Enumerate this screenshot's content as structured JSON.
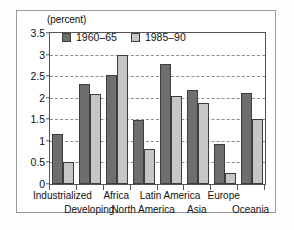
{
  "chart_data": {
    "type": "bar",
    "title": "",
    "subtitle": "",
    "xlabel": "",
    "ylabel": "",
    "unit_label": "(percent)",
    "categories": [
      "Industrialized",
      "Developing",
      "Africa",
      "North America",
      "Latin America",
      "Asia",
      "Europe",
      "Oceania"
    ],
    "category_rows": [
      0,
      1,
      0,
      1,
      0,
      1,
      0,
      1
    ],
    "series": [
      {
        "name": "1960–65",
        "color": "#6e6e6e",
        "values": [
          1.17,
          2.32,
          2.53,
          1.48,
          2.78,
          2.19,
          0.92,
          2.1
        ]
      },
      {
        "name": "1985–90",
        "color": "#c6c6c6",
        "values": [
          0.52,
          2.09,
          3.0,
          0.81,
          2.05,
          1.87,
          0.25,
          1.5
        ]
      }
    ],
    "ylim": [
      0,
      3.5
    ],
    "yticks": [
      0,
      0.5,
      1,
      1.5,
      2,
      2.5,
      3,
      3.5
    ],
    "ytick_labels": [
      "0",
      "0.5",
      "1",
      "1.5",
      "2",
      "2.5",
      "3",
      "3.5"
    ],
    "grid": true,
    "grid_style": "dashed",
    "grid_color": "#8d8d8d",
    "legend_position": "top-left-inside",
    "axis_color": "#555555",
    "frame_color": "#9a9a9a",
    "background": "#ffffff"
  }
}
